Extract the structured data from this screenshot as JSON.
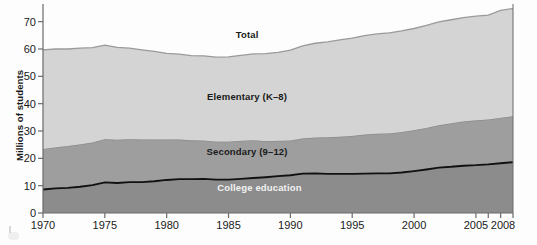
{
  "chart_data": {
    "type": "area",
    "stacked": true,
    "title": "",
    "xlabel": "",
    "ylabel": "Millions of students",
    "xlim": [
      1970,
      2008
    ],
    "ylim": [
      0,
      75
    ],
    "yticks": [
      0,
      10,
      20,
      30,
      40,
      50,
      60,
      70
    ],
    "ytick_labels": [
      "0",
      "10",
      "20",
      "30",
      "40",
      "50",
      "60",
      "70"
    ],
    "xticks": [
      1970,
      1975,
      1980,
      1985,
      1990,
      1995,
      2000,
      2005,
      2008
    ],
    "xtick_labels": [
      "1970",
      "1975",
      "1980",
      "1985",
      "1990",
      "1995",
      "2000",
      "2005",
      "2008"
    ],
    "minor_xticks": [
      2006,
      2007
    ],
    "grid": false,
    "legend_position": "inline-annotations",
    "x": [
      1970,
      1971,
      1972,
      1973,
      1974,
      1975,
      1976,
      1977,
      1978,
      1979,
      1980,
      1981,
      1982,
      1983,
      1984,
      1985,
      1986,
      1987,
      1988,
      1989,
      1990,
      1991,
      1992,
      1993,
      1994,
      1995,
      1996,
      1997,
      1998,
      1999,
      2000,
      2001,
      2002,
      2003,
      2004,
      2005,
      2006,
      2007,
      2008
    ],
    "series": [
      {
        "name": "College education",
        "label": "College education",
        "color": "#8c8c8c",
        "values": [
          8.6,
          9.0,
          9.2,
          9.6,
          10.2,
          11.2,
          11.0,
          11.3,
          11.3,
          11.6,
          12.1,
          12.4,
          12.4,
          12.5,
          12.2,
          12.2,
          12.5,
          12.8,
          13.1,
          13.5,
          13.8,
          14.4,
          14.5,
          14.3,
          14.3,
          14.3,
          14.4,
          14.5,
          14.5,
          14.8,
          15.3,
          15.9,
          16.6,
          16.9,
          17.3,
          17.5,
          17.8,
          18.2,
          18.6
        ]
      },
      {
        "name": "Secondary (9-12)",
        "label": "Secondary (9–12)",
        "color": "#9e9e9e",
        "values": [
          14.6,
          14.8,
          15.1,
          15.3,
          15.4,
          15.6,
          15.6,
          15.5,
          15.4,
          15.1,
          14.6,
          14.3,
          14.0,
          13.8,
          13.7,
          13.7,
          13.7,
          13.6,
          13.0,
          12.7,
          12.5,
          12.7,
          12.9,
          13.2,
          13.4,
          13.7,
          14.1,
          14.3,
          14.4,
          14.6,
          14.8,
          15.0,
          15.3,
          15.7,
          16.0,
          16.2,
          16.2,
          16.4,
          16.6
        ]
      },
      {
        "name": "Elementary (K-8)",
        "label": "Elementary (K–8)",
        "color": "#d4d4d4",
        "values": [
          36.5,
          36.2,
          35.7,
          35.4,
          34.9,
          34.6,
          34.0,
          33.5,
          33.0,
          32.4,
          31.7,
          31.4,
          31.2,
          31.2,
          31.1,
          31.2,
          31.5,
          31.8,
          32.2,
          32.6,
          33.3,
          34.0,
          34.7,
          35.1,
          35.6,
          36.0,
          36.4,
          36.7,
          37.0,
          37.2,
          37.4,
          37.7,
          38.0,
          38.1,
          38.2,
          38.3,
          38.4,
          39.5,
          39.6
        ]
      }
    ],
    "total": {
      "name": "Total",
      "label": "Total",
      "color": "#9a9a9a",
      "values": [
        59.7,
        60.0,
        60.0,
        60.3,
        60.5,
        61.4,
        60.6,
        60.3,
        59.7,
        59.1,
        58.4,
        58.1,
        57.6,
        57.5,
        57.0,
        57.1,
        57.7,
        58.2,
        58.3,
        58.8,
        59.6,
        61.1,
        62.1,
        62.6,
        63.3,
        64.0,
        64.9,
        65.5,
        65.9,
        66.6,
        67.5,
        68.6,
        69.9,
        70.7,
        71.5,
        72.0,
        72.4,
        74.1,
        74.8
      ]
    },
    "annotations": [
      {
        "text": "Total",
        "x": 1986.5,
        "y": 65.0,
        "style": "dark"
      },
      {
        "text": "Elementary (K–8)",
        "x": 1986.5,
        "y": 42.5,
        "style": "dark"
      },
      {
        "text": "Secondary (9–12)",
        "x": 1986.5,
        "y": 22.5,
        "style": "dark"
      },
      {
        "text": "College education",
        "x": 1987.5,
        "y": 9.2,
        "style": "light"
      }
    ]
  },
  "axis": {
    "y_title": "Millions of students"
  },
  "colors": {
    "axis": "#6b6b6b",
    "total_line": "#9a9a9a",
    "elementary_fill": "#d4d4d4",
    "elementary_line": "#8f8f8f",
    "secondary_fill": "#9e9e9e",
    "secondary_line": "#b0b0b0",
    "college_fill": "#8c8c8c",
    "college_line": "#111111",
    "background": "#fdfdfd",
    "text": "#1a1a1a",
    "text_light": "#f2f2f2"
  }
}
